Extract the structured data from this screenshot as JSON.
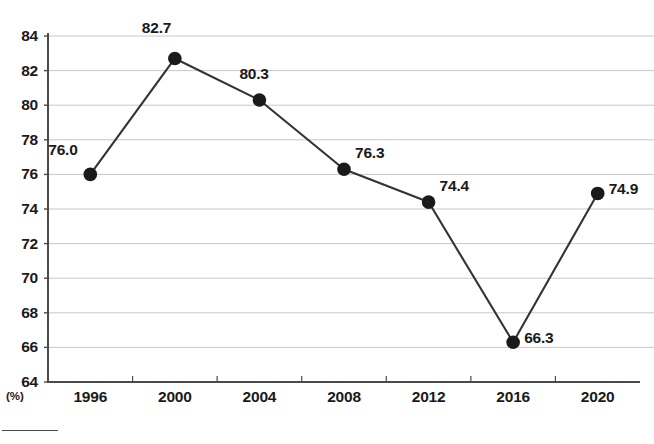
{
  "chart_data": {
    "type": "line",
    "title": "",
    "subtitle": "",
    "xlabel": "",
    "ylabel": "",
    "unit_label": "(%)",
    "categories": [
      "1996",
      "2000",
      "2004",
      "2008",
      "2012",
      "2016",
      "2020"
    ],
    "values": [
      76.0,
      82.7,
      80.3,
      76.3,
      74.4,
      66.3,
      74.9
    ],
    "point_labels": [
      "76.0",
      "82.7",
      "80.3",
      "76.3",
      "74.4",
      "66.3",
      "74.9"
    ],
    "series": [
      {
        "name": "",
        "values": [
          76.0,
          82.7,
          80.3,
          76.3,
          74.4,
          66.3,
          74.9
        ]
      }
    ],
    "ylim": [
      64,
      84
    ],
    "ytick_step": 2,
    "ytick_labels": [
      "84",
      "82",
      "80",
      "78",
      "76",
      "74",
      "72",
      "70",
      "68",
      "66",
      "64"
    ],
    "ytick_values": [
      84,
      82,
      80,
      78,
      76,
      74,
      72,
      70,
      68,
      66,
      64
    ],
    "grid": true,
    "grid_axis": "y",
    "legend": false,
    "legend_position": "none",
    "marker": "circle",
    "colors": {
      "line": "#333333",
      "marker": "#1a1a1a",
      "grid": "#c8c8c8",
      "axis": "#4a4a4a",
      "text": "#1a1a1a",
      "background": "#ffffff"
    }
  }
}
